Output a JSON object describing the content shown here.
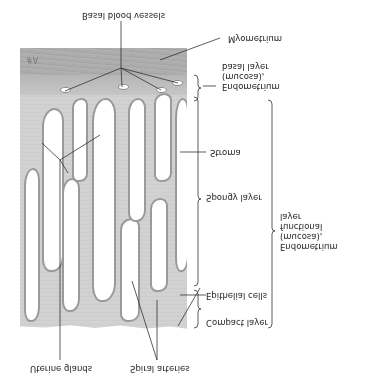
{
  "figure": {
    "orientation": "vertically-flipped",
    "labels": {
      "basal_blood_vessels": "Basal blood vessels",
      "myometrium": "Myometrium",
      "endometrium_basal": "Endometrium\n(mucosa),\nbasal layer",
      "stroma": "Stroma",
      "spongy_layer": "Spongy layer",
      "endometrium_functional": "Endometrium\n(mucosa),\nfunctional\nlayer",
      "epithelial_cells": "Epithelial cells",
      "compact_layer": "Compact layer",
      "spiral_arteries": "Spiral arteries",
      "uterine_glands": "Uterine glands"
    },
    "signature": "#A",
    "colors": {
      "myometrium": "#a9a9a9",
      "stroma": "#cfcfcf",
      "gland_lumen": "#ffffff",
      "gland_border": "#9a9a9a",
      "line": "#333333"
    }
  }
}
